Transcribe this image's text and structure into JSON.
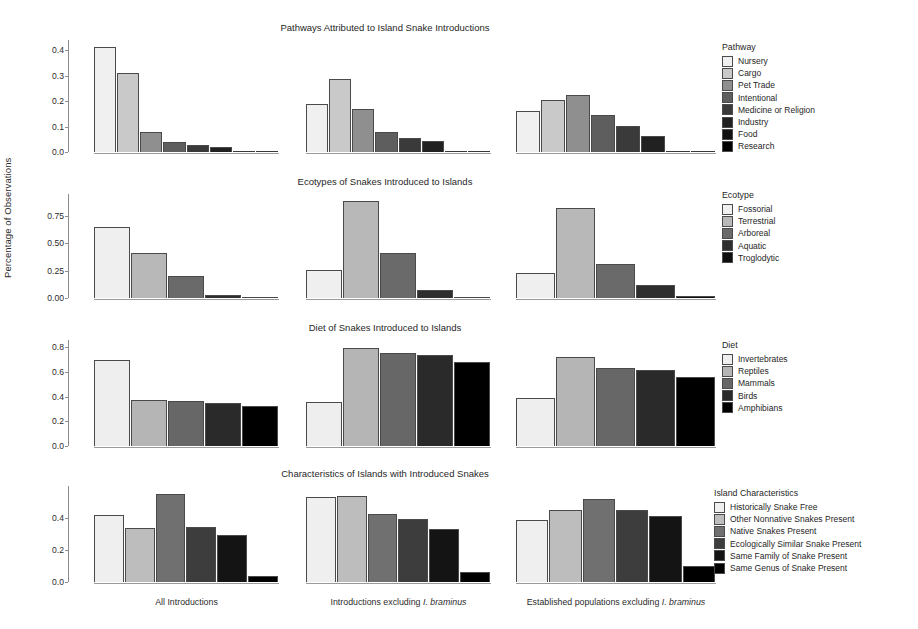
{
  "figure": {
    "ylabel": "Percentage of Observations",
    "groups": [
      "All Introductions",
      "Introductions excluding I. braminus",
      "Established populations excluding I. braminus"
    ],
    "group_label_parts": [
      {
        "pre": "All Introductions",
        "italic": "",
        "post": ""
      },
      {
        "pre": "Introductions excluding ",
        "italic": "I. braminus",
        "post": ""
      },
      {
        "pre": "Established populations excluding ",
        "italic": "I. braminus",
        "post": ""
      }
    ]
  },
  "chart_data": [
    {
      "type": "bar",
      "title": "Pathways Attributed to Island Snake Introductions",
      "legend_title": "Pathway",
      "legend_position": "right",
      "xlabel": "",
      "ylabel": "Percentage of Observations",
      "ylim": [
        0,
        0.44
      ],
      "yticks": [
        0.0,
        0.1,
        0.2,
        0.3,
        0.4
      ],
      "ytick_labels": [
        "0.0",
        "0.1",
        "0.2",
        "0.3",
        "0.4"
      ],
      "grid": false,
      "categories": [
        "All Introductions",
        "Introductions excluding I. braminus",
        "Established populations excluding I. braminus"
      ],
      "series": [
        {
          "name": "Nursery",
          "color": "#f0f0f0",
          "values": [
            0.412,
            0.19,
            0.163
          ]
        },
        {
          "name": "Cargo",
          "color": "#c9c9c9",
          "values": [
            0.312,
            0.285,
            0.205
          ]
        },
        {
          "name": "Pet Trade",
          "color": "#8f8f8f",
          "values": [
            0.08,
            0.17,
            0.225
          ]
        },
        {
          "name": "Intentional",
          "color": "#5e5e5e",
          "values": [
            0.04,
            0.078,
            0.145
          ]
        },
        {
          "name": "Medicine or Religion",
          "color": "#3a3a3a",
          "values": [
            0.028,
            0.057,
            0.103
          ]
        },
        {
          "name": "Industry",
          "color": "#212121",
          "values": [
            0.021,
            0.045,
            0.062
          ]
        },
        {
          "name": "Food",
          "color": "#111111",
          "values": [
            0.0,
            0.0,
            0.0
          ]
        },
        {
          "name": "Research",
          "color": "#000000",
          "values": [
            0.0,
            0.0,
            0.0
          ]
        }
      ]
    },
    {
      "type": "bar",
      "title": "Ecotypes of Snakes Introduced to Islands",
      "legend_title": "Ecotype",
      "legend_position": "right",
      "xlabel": "",
      "ylabel": "Percentage of Observations",
      "ylim": [
        0,
        0.95
      ],
      "yticks": [
        0.0,
        0.25,
        0.5,
        0.75
      ],
      "ytick_labels": [
        "0.00",
        "0.25",
        "0.50",
        "0.75"
      ],
      "grid": false,
      "categories": [
        "All Introductions",
        "Introductions excluding I. braminus",
        "Established populations excluding I. braminus"
      ],
      "series": [
        {
          "name": "Fossorial",
          "color": "#efefef",
          "values": [
            0.645,
            0.258,
            0.228
          ]
        },
        {
          "name": "Terrestrial",
          "color": "#b8b8b8",
          "values": [
            0.415,
            0.888,
            0.825
          ]
        },
        {
          "name": "Arboreal",
          "color": "#6a6a6a",
          "values": [
            0.198,
            0.408,
            0.308
          ]
        },
        {
          "name": "Aquatic",
          "color": "#2e2e2e",
          "values": [
            0.032,
            0.075,
            0.122
          ]
        },
        {
          "name": "Troglodytic",
          "color": "#0d0d0d",
          "values": [
            0.008,
            0.01,
            0.018
          ]
        }
      ]
    },
    {
      "type": "bar",
      "title": "Diet of Snakes Introduced to Islands",
      "legend_title": "Diet",
      "legend_position": "right",
      "xlabel": "",
      "ylabel": "Percentage of Observations",
      "ylim": [
        0,
        0.86
      ],
      "yticks": [
        0.0,
        0.2,
        0.4,
        0.6,
        0.8
      ],
      "ytick_labels": [
        "0.0",
        "0.2",
        "0.4",
        "0.6",
        "0.8"
      ],
      "grid": false,
      "categories": [
        "All Introductions",
        "Introductions excluding I. braminus",
        "Established populations excluding I. braminus"
      ],
      "series": [
        {
          "name": "Invertebrates",
          "color": "#eeeeee",
          "values": [
            0.695,
            0.358,
            0.392
          ]
        },
        {
          "name": "Reptiles",
          "color": "#b5b5b5",
          "values": [
            0.373,
            0.793,
            0.723
          ]
        },
        {
          "name": "Mammals",
          "color": "#676767",
          "values": [
            0.363,
            0.757,
            0.633
          ]
        },
        {
          "name": "Birds",
          "color": "#2a2a2a",
          "values": [
            0.351,
            0.738,
            0.617
          ]
        },
        {
          "name": "Amphibians",
          "color": "#000000",
          "values": [
            0.325,
            0.678,
            0.558
          ]
        }
      ]
    },
    {
      "type": "bar",
      "title": "Characteristics of Islands with Introduced Snakes",
      "legend_title": "Island Characteristics",
      "legend_position": "right",
      "xlabel": "",
      "ylabel": "Percentage of Observations",
      "ylim": [
        0,
        0.6
      ],
      "yticks": [
        0.0,
        0.2,
        0.4
      ],
      "ytick_labels": [
        "0.0",
        "0.2",
        "0.4"
      ],
      "grid": false,
      "categories": [
        "All Introductions",
        "Introductions excluding I. braminus",
        "Established populations excluding I. braminus"
      ],
      "series": [
        {
          "name": "Historically Snake Free",
          "color": "#efefef",
          "values": [
            0.418,
            0.533,
            0.39
          ]
        },
        {
          "name": "Other Nonnative Snakes Present",
          "color": "#bdbdbd",
          "values": [
            0.335,
            0.54,
            0.452
          ]
        },
        {
          "name": "Native Snakes Present",
          "color": "#707070",
          "values": [
            0.548,
            0.423,
            0.52
          ]
        },
        {
          "name": "Ecologically Similar Snake Present",
          "color": "#3d3d3d",
          "values": [
            0.342,
            0.392,
            0.448
          ]
        },
        {
          "name": "Same Family of Snake Present",
          "color": "#141414",
          "values": [
            0.293,
            0.333,
            0.412
          ]
        },
        {
          "name": "Same Genus of Snake Present",
          "color": "#000000",
          "values": [
            0.035,
            0.062,
            0.1
          ]
        }
      ]
    }
  ]
}
